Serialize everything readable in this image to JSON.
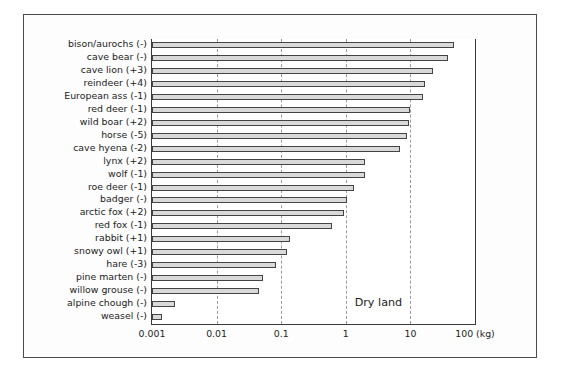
{
  "chart_data": {
    "type": "bar",
    "orientation": "horizontal",
    "title": "",
    "xlabel": "(kg)",
    "ylabel": "",
    "xscale": "log",
    "xlim": [
      0.001,
      100
    ],
    "xticks": [
      0.001,
      0.01,
      0.1,
      1,
      10,
      100
    ],
    "xticklabels": [
      "0.001",
      "0.01",
      "0.1",
      "1",
      "10",
      "100 (kg)"
    ],
    "grid": "vertical-dashed",
    "legend": "none",
    "annotations": [
      {
        "text": "Dry land",
        "x": 3.2,
        "row_index": 20
      }
    ],
    "categories": [
      "bison/aurochs (-)",
      "cave bear (-)",
      "cave lion (+3)",
      "reindeer (+4)",
      "European ass (-1)",
      "red deer (-1)",
      "wild boar (+2)",
      "horse (-5)",
      "cave hyena (-2)",
      "lynx (+2)",
      "wolf (-1)",
      "roe deer (-1)",
      "badger (-)",
      "arctic fox (+2)",
      "red fox (-1)",
      "rabbit (+1)",
      "snowy owl (+1)",
      "hare (-3)",
      "pine marten (-)",
      "willow grouse (-)",
      "alpine chough (-)",
      "weasel (-)"
    ],
    "values": [
      48,
      38,
      22,
      17,
      15.5,
      10,
      9.5,
      8.8,
      7.0,
      2.0,
      2.0,
      1.35,
      1.05,
      0.95,
      0.62,
      0.135,
      0.125,
      0.082,
      0.052,
      0.046,
      0.0023,
      0.00145
    ]
  }
}
